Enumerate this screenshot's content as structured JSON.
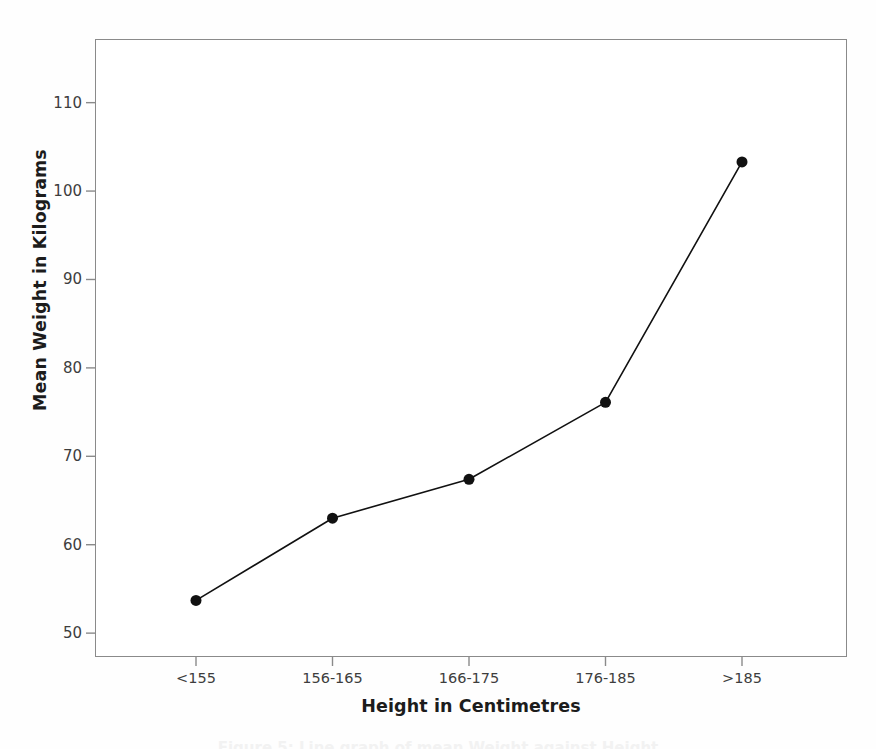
{
  "figure": {
    "background_color": "#fefefe",
    "plot_background_color": "#ffffff",
    "frame_color": "#8a8a8a",
    "series_color": "#111111",
    "tick_text_color": "#3d3d3d",
    "axis_title_color": "#1c1c1c",
    "bottom_caption": "Figure 5: Line graph of mean Weight against Height"
  },
  "chart_data": {
    "type": "line",
    "title": "",
    "subtitle": "",
    "xlabel": "Height in Centimetres",
    "ylabel": "Mean Weight in Kilograms",
    "categories": [
      "<155",
      "156-165",
      "166-175",
      "176-185",
      ">185"
    ],
    "values": [
      53.7,
      63.0,
      67.4,
      76.1,
      103.3
    ],
    "series": [
      {
        "name": "Mean Weight in Kilograms",
        "values": [
          53.7,
          63.0,
          67.4,
          76.1,
          103.3
        ],
        "color": "#111111",
        "marker": "filled-circle",
        "marker_size": 11,
        "line_width": 1.6
      }
    ],
    "ylim": [
      47.3,
      117.2
    ],
    "yticks": [
      50,
      60,
      70,
      80,
      90,
      100,
      110
    ],
    "ytick_labels": [
      "50",
      "60",
      "70",
      "80",
      "90",
      "100",
      "110"
    ],
    "xtick_labels": [
      "<155",
      "156-165",
      "166-175",
      "176-185",
      ">185"
    ],
    "grid": false,
    "legend": false,
    "legend_position": "none",
    "annotations": []
  },
  "axes": {
    "y_title": "Mean Weight in Kilograms",
    "x_title": "Height in Centimetres"
  }
}
